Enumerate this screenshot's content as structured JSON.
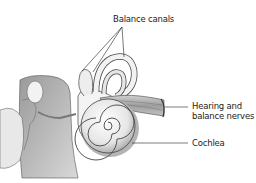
{
  "diagram": {
    "labels": {
      "balance_canals": "Balance canals",
      "nerves_line1": "Hearing and",
      "nerves_line2": "balance nerves",
      "cochlea": "Cochlea"
    },
    "colors": {
      "background": "#ffffff",
      "structure_light": "#eeeeee",
      "structure_mid": "#bdbdbd",
      "structure_dark": "#7a7a7a",
      "outline": "#3a3a3a",
      "text": "#222222"
    }
  }
}
